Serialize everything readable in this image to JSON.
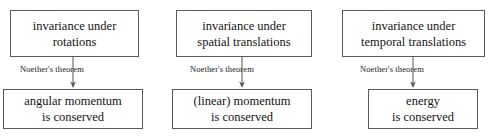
{
  "diagram": {
    "type": "flow-diagram",
    "background_color": "#ffffff",
    "border_color": "#5a5a5a",
    "text_color": "#141414",
    "columns": [
      {
        "id": "rotations",
        "premise": {
          "line1": "invariance under",
          "line2": "rotations"
        },
        "edge_label": "Noether's theorem",
        "conclusion": {
          "line1": "angular momentum",
          "line2": "is conserved"
        }
      },
      {
        "id": "spatial-translations",
        "premise": {
          "line1": "invariance under",
          "line2": "spatial translations"
        },
        "edge_label": "Noether's theorem",
        "conclusion": {
          "line1": "(linear) momentum",
          "line2": "is conserved"
        }
      },
      {
        "id": "temporal-translations",
        "premise": {
          "line1": "invariance under",
          "line2": "temporal translations"
        },
        "edge_label": "Noether's theorem",
        "conclusion": {
          "line1": "energy",
          "line2": "is conserved"
        }
      }
    ]
  }
}
